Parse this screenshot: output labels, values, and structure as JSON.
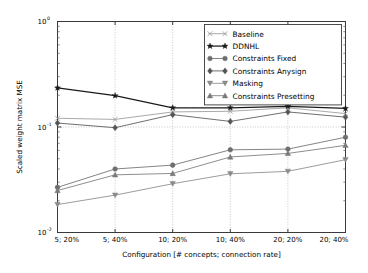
{
  "chart_data": {
    "type": "line",
    "title": "",
    "xlabel": "Configuration [# concepts; connection rate]",
    "ylabel": "Scaled weight matrix MSE",
    "yscale": "log",
    "ylim": [
      0.01,
      1.0
    ],
    "ytick_labels": [
      "10^0",
      "10^-1",
      "10^-2"
    ],
    "ytick_values": [
      1.0,
      0.1,
      0.01
    ],
    "grid": "dotted vertical gridlines at each category; dotted horizontal line at 10^-1",
    "legend_position": "top-right inside axes",
    "categories": [
      "5; 20%",
      "5; 40%",
      "10; 20%",
      "10; 40%",
      "20; 20%",
      "20; 40%"
    ],
    "series": [
      {
        "name": "Baseline",
        "marker": "x",
        "color": "#9a9a9a",
        "values": [
          0.121,
          0.118,
          0.139,
          0.141,
          0.152,
          0.134
        ]
      },
      {
        "name": "DDNHL",
        "marker": "star",
        "color": "#1a1a1a",
        "values": [
          0.235,
          0.198,
          0.152,
          0.152,
          0.157,
          0.15
        ]
      },
      {
        "name": "Constraints Fixed",
        "marker": "circle",
        "color": "#6e6e6e",
        "values": [
          0.0268,
          0.04,
          0.0435,
          0.0608,
          0.0617,
          0.08
        ]
      },
      {
        "name": "Constraints Anysign",
        "marker": "diamond",
        "color": "#555555",
        "values": [
          0.109,
          0.0985,
          0.131,
          0.113,
          0.139,
          0.124
        ]
      },
      {
        "name": "Masking",
        "marker": "triangle-down",
        "color": "#8a8a8a",
        "values": [
          0.0184,
          0.0226,
          0.029,
          0.036,
          0.038,
          0.049
        ]
      },
      {
        "name": "Constraints Presetting",
        "marker": "triangle-up",
        "color": "#7a7a7a",
        "values": [
          0.025,
          0.0352,
          0.0363,
          0.052,
          0.0562,
          0.067
        ]
      }
    ]
  }
}
